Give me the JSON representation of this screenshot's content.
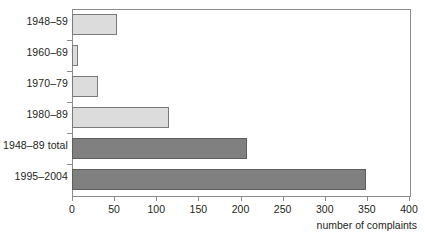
{
  "chart_data": {
    "type": "bar",
    "orientation": "horizontal",
    "title": "",
    "subtitle": "",
    "xlabel": "number of complaints",
    "ylabel": "",
    "categories": [
      "1948–59",
      "1960–69",
      "1970–79",
      "1980–89",
      "1948–89 total",
      "1995–2004"
    ],
    "values": [
      54,
      7,
      31,
      115,
      208,
      349
    ],
    "xlim": [
      0,
      400
    ],
    "xticks": [
      0,
      50,
      100,
      150,
      200,
      250,
      300,
      350,
      400
    ],
    "xtick_labels": [
      "0",
      "50",
      "100",
      "150",
      "200",
      "250",
      "300",
      "350",
      "400"
    ],
    "grid": false,
    "legend": "none",
    "series": [
      {
        "name": "complaints",
        "values": [
          54,
          7,
          31,
          115,
          208,
          349
        ],
        "bar_styles": [
          "light",
          "light",
          "light",
          "light",
          "dark",
          "dark"
        ]
      }
    ],
    "colors": {
      "light_bar_fill": "#dcdcdc",
      "light_bar_stroke": "#7a7a7a",
      "dark_bar_fill": "#808080",
      "dark_bar_stroke": "#5d5d5d",
      "axis": "#8c8c8c",
      "text": "#231f20",
      "background": "#ffffff"
    }
  }
}
